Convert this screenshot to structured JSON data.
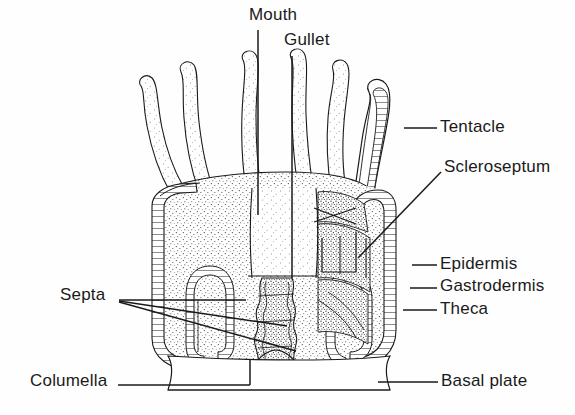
{
  "figure": {
    "background_color": "#ffffff",
    "ink_color": "#1a1a1a",
    "width": 575,
    "height": 415
  },
  "labels": {
    "mouth": "Mouth",
    "gullet": "Gullet",
    "tentacle": "Tentacle",
    "scleroseptum": "Scleroseptum",
    "epidermis": "Epidermis",
    "gastrodermis": "Gastrodermis",
    "theca": "Theca",
    "septa": "Septa",
    "columella": "Columella",
    "basal_plate": "Basal plate"
  },
  "label_positions": {
    "mouth": {
      "x": 249,
      "y": 5,
      "anchor": "start"
    },
    "gullet": {
      "x": 284,
      "y": 30,
      "anchor": "start"
    },
    "tentacle": {
      "x": 440,
      "y": 117,
      "anchor": "start"
    },
    "scleroseptum": {
      "x": 444,
      "y": 157,
      "anchor": "start"
    },
    "epidermis": {
      "x": 440,
      "y": 254,
      "anchor": "start"
    },
    "gastrodermis": {
      "x": 440,
      "y": 276,
      "anchor": "start"
    },
    "theca": {
      "x": 440,
      "y": 299,
      "anchor": "start"
    },
    "septa": {
      "x": 60,
      "y": 285,
      "anchor": "start"
    },
    "columella": {
      "x": 30,
      "y": 371,
      "anchor": "start"
    },
    "basal_plate": {
      "x": 441,
      "y": 371,
      "anchor": "start"
    }
  },
  "leader_lines": [
    {
      "name": "mouth-leader",
      "points": "258,30 258,215"
    },
    {
      "name": "gullet-leader",
      "points": "292,56 292,278"
    },
    {
      "name": "tentacle-leader",
      "points": "404,128 437,128"
    },
    {
      "name": "scleroseptum-leader",
      "points": "441,172 358,258"
    },
    {
      "name": "epidermis-leader",
      "points": "412,265 437,265"
    },
    {
      "name": "gastrodermis-leader",
      "points": "410,288 437,288"
    },
    {
      "name": "theca-leader",
      "points": "403,310 437,310"
    },
    {
      "name": "septa-leader-1",
      "points": "119,300 246,300"
    },
    {
      "name": "septa-leader-2",
      "points": "119,301 287,326"
    },
    {
      "name": "septa-leader-3",
      "points": "119,302 296,351"
    },
    {
      "name": "columella-leader",
      "points": "118,385 250,385"
    },
    {
      "name": "columella-drop",
      "points": "250,385 250,360"
    },
    {
      "name": "basal-plate-leader",
      "points": "378,382 438,382"
    }
  ],
  "anatomy_parts": [
    {
      "name": "tentacle-1",
      "description": "outer left tentacle, stippled"
    },
    {
      "name": "tentacle-2",
      "description": "left tentacle, stippled"
    },
    {
      "name": "tentacle-3",
      "description": "inner left tentacle, stippled"
    },
    {
      "name": "tentacle-4",
      "description": "inner right tentacle, stippled"
    },
    {
      "name": "tentacle-5",
      "description": "right tentacle, stippled"
    },
    {
      "name": "tentacle-6",
      "description": "outermost right tentacle shown in section with ladder-hatched wall"
    },
    {
      "name": "oral-disc",
      "description": "stippled disc bearing the tentacle ring"
    },
    {
      "name": "mouth-opening",
      "description": "central slit at the top of the gullet"
    },
    {
      "name": "gullet-tube",
      "description": "stippled pharynx descending into the gastrovascular cavity"
    },
    {
      "name": "theca-wall",
      "description": "ladder-hatched calcareous cup enclosing the polyp"
    },
    {
      "name": "septum-loop-left",
      "description": "ladder-hatched septal fold on the left interior"
    },
    {
      "name": "septum-loop-right",
      "description": "ladder-hatched septal fold on the right interior"
    },
    {
      "name": "scleroseptum-plates",
      "description": "cut-away radiating skeletal plates, densely stippled"
    },
    {
      "name": "columella-column",
      "description": "rough central skeletal column below the gullet"
    },
    {
      "name": "basal-plate-slab",
      "description": "flat skeletal base plate at the bottom"
    }
  ]
}
